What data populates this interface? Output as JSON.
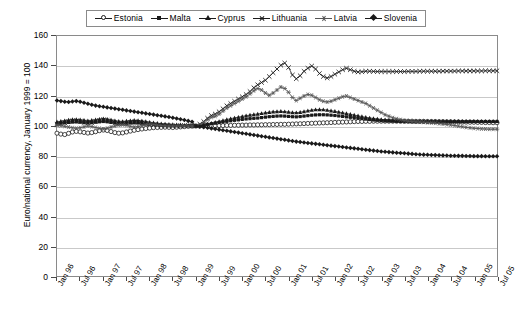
{
  "chart_data": {
    "type": "line",
    "title": "",
    "xlabel": "",
    "ylabel": "Euro/national currency, January 1999 = 100",
    "ylim": [
      0,
      160
    ],
    "ytick_step": 20,
    "yticks": [
      0,
      20,
      40,
      60,
      80,
      100,
      120,
      140,
      160
    ],
    "grid": true,
    "legend_position": "top",
    "x_tick_labels": [
      "Jan 96",
      "Jul 96",
      "Jan 97",
      "Jul 97",
      "Jan 98",
      "Jul 98",
      "Jan 99",
      "Jul 99",
      "Jan 00",
      "Jul 00",
      "Jan 01",
      "Jul 01",
      "Jan 02",
      "Jul 02",
      "Jan 03",
      "Jul 03",
      "Jan 04",
      "Jul 04",
      "Jan 05",
      "Jul 05"
    ],
    "x_start": "Jan 96",
    "x_end": "Jul 05",
    "x_frequency": "monthly",
    "n_points": 115,
    "series": [
      {
        "name": "Estonia",
        "marker": "circle-open",
        "color": "#1a1a1a",
        "values": [
          95.2,
          94.6,
          94.3,
          95.1,
          96.0,
          96.4,
          96.1,
          95.7,
          95.3,
          95.6,
          96.2,
          96.9,
          97.3,
          97.0,
          96.3,
          95.6,
          95.2,
          95.4,
          96.0,
          96.6,
          97.1,
          97.6,
          98.0,
          98.3,
          98.6,
          98.9,
          99.0,
          99.1,
          99.2,
          99.1,
          99.0,
          99.2,
          99.4,
          99.6,
          99.8,
          99.9,
          100.0,
          100.0,
          100.1,
          100.1,
          100.2,
          100.2,
          100.3,
          100.3,
          100.4,
          100.4,
          100.5,
          100.5,
          100.6,
          100.6,
          100.7,
          100.7,
          100.8,
          100.8,
          100.9,
          100.9,
          101.0,
          101.0,
          101.1,
          101.1,
          101.2,
          101.3,
          101.4,
          101.5,
          101.6,
          101.7,
          101.8,
          101.9,
          102.0,
          102.1,
          102.2,
          102.3,
          102.4,
          102.5,
          102.6,
          102.7,
          102.8,
          102.9,
          103.0,
          103.0,
          103.1,
          103.1,
          103.2,
          103.2,
          103.2,
          103.2,
          103.2,
          103.2,
          103.2,
          103.2,
          103.2,
          103.2,
          103.2,
          103.1,
          103.1,
          103.1,
          103.0,
          103.0,
          103.0,
          102.9,
          102.9,
          102.8,
          102.8,
          102.7,
          102.7,
          102.6,
          102.6,
          102.5,
          102.5,
          102.4,
          102.4,
          102.3,
          102.3,
          102.2,
          102.2
        ]
      },
      {
        "name": "Malta",
        "marker": "square-small",
        "color": "#1a1a1a",
        "values": [
          101.5,
          101.8,
          102.1,
          102.4,
          102.6,
          102.7,
          102.5,
          102.2,
          102.0,
          102.2,
          102.5,
          102.8,
          103.0,
          102.8,
          102.4,
          102.0,
          101.7,
          101.6,
          101.8,
          102.0,
          102.1,
          102.0,
          101.8,
          101.5,
          101.2,
          100.9,
          100.7,
          100.5,
          100.4,
          100.3,
          100.2,
          100.2,
          100.2,
          100.2,
          100.1,
          100.1,
          100.0,
          100.3,
          100.7,
          101.1,
          101.5,
          101.9,
          102.3,
          102.7,
          103.1,
          103.5,
          103.8,
          104.1,
          104.4,
          104.7,
          104.9,
          105.1,
          105.3,
          105.6,
          105.9,
          106.2,
          106.4,
          106.6,
          106.7,
          106.6,
          106.4,
          106.2,
          106.1,
          106.3,
          106.6,
          106.9,
          107.2,
          107.4,
          107.5,
          107.5,
          107.4,
          107.2,
          107.0,
          106.7,
          106.4,
          106.1,
          105.8,
          105.5,
          105.2,
          104.9,
          104.6,
          104.3,
          104.0,
          103.8,
          103.6,
          103.4,
          103.3,
          103.2,
          103.1,
          103.0,
          102.9,
          102.9,
          102.8,
          102.8,
          102.8,
          102.8,
          102.8,
          102.8,
          102.8,
          102.8,
          102.8,
          102.8,
          102.8,
          102.9,
          102.9,
          102.9,
          102.9,
          103.0,
          103.0,
          103.0,
          103.0,
          103.0,
          103.0,
          103.0,
          103.0
        ]
      },
      {
        "name": "Cyprus",
        "marker": "triangle",
        "color": "#1a1a1a",
        "values": [
          102.8,
          103.2,
          103.6,
          104.0,
          104.3,
          104.4,
          104.2,
          103.9,
          103.6,
          103.8,
          104.2,
          104.6,
          104.9,
          104.6,
          104.1,
          103.6,
          103.2,
          103.1,
          103.3,
          103.6,
          103.8,
          103.7,
          103.4,
          103.0,
          102.6,
          102.2,
          101.9,
          101.6,
          101.4,
          101.2,
          101.0,
          100.9,
          100.8,
          100.6,
          100.4,
          100.2,
          100.0,
          100.4,
          100.9,
          101.4,
          101.9,
          102.5,
          103.1,
          103.7,
          104.3,
          104.9,
          105.4,
          105.9,
          106.4,
          106.9,
          107.3,
          107.7,
          108.0,
          108.4,
          108.8,
          109.2,
          109.5,
          109.7,
          109.8,
          109.6,
          109.3,
          109.0,
          108.9,
          109.2,
          109.7,
          110.2,
          110.6,
          110.9,
          111.0,
          110.9,
          110.6,
          110.2,
          109.8,
          109.3,
          108.8,
          108.3,
          107.8,
          107.3,
          106.8,
          106.3,
          105.8,
          105.4,
          105.0,
          104.7,
          104.4,
          104.2,
          104.0,
          103.8,
          103.6,
          103.5,
          103.4,
          103.3,
          103.2,
          103.2,
          103.2,
          103.2,
          103.2,
          103.2,
          103.2,
          103.2,
          103.2,
          103.2,
          103.2,
          103.2,
          103.2,
          103.2,
          103.2,
          103.2,
          103.2,
          103.2,
          103.2,
          103.2,
          103.2,
          103.2,
          103.2
        ]
      },
      {
        "name": "Lithuania",
        "marker": "x",
        "color": "#1a1a1a",
        "values": [
          101.0,
          101.6,
          102.2,
          102.9,
          103.4,
          103.5,
          103.0,
          102.4,
          101.9,
          102.3,
          103.0,
          103.7,
          104.2,
          103.7,
          102.9,
          102.2,
          101.6,
          101.5,
          101.9,
          102.4,
          102.8,
          102.6,
          102.1,
          101.5,
          101.0,
          100.6,
          100.4,
          100.2,
          100.1,
          100.1,
          100.0,
          100.1,
          100.2,
          100.3,
          100.3,
          100.2,
          100.0,
          101.2,
          103.0,
          105.2,
          107.0,
          108.0,
          109.5,
          111.5,
          113.5,
          115.0,
          116.5,
          118.0,
          119.5,
          121.0,
          123.0,
          125.5,
          127.5,
          129.0,
          130.5,
          133.0,
          135.5,
          138.0,
          140.5,
          142.0,
          139.0,
          134.0,
          131.5,
          133.5,
          136.5,
          138.5,
          140.0,
          138.0,
          135.0,
          133.0,
          132.0,
          133.0,
          134.5,
          136.0,
          137.5,
          138.5,
          137.5,
          136.5,
          136.0,
          136.2,
          136.5,
          136.5,
          136.4,
          136.3,
          136.3,
          136.3,
          136.3,
          136.3,
          136.3,
          136.3,
          136.3,
          136.4,
          136.4,
          136.4,
          136.5,
          136.5,
          136.5,
          136.5,
          136.5,
          136.5,
          136.6,
          136.6,
          136.6,
          136.6,
          136.7,
          136.7,
          136.7,
          136.7,
          136.7,
          136.7,
          136.7,
          136.8,
          136.8,
          136.8,
          136.8
        ]
      },
      {
        "name": "Latvia",
        "marker": "star",
        "color": "#555555",
        "values": [
          100.5,
          100.2,
          99.8,
          99.3,
          98.8,
          98.5,
          98.8,
          99.4,
          100.0,
          99.6,
          99.0,
          98.4,
          98.0,
          98.5,
          99.3,
          100.0,
          100.6,
          100.8,
          100.4,
          99.8,
          99.3,
          99.6,
          100.2,
          100.8,
          101.2,
          101.0,
          100.6,
          100.3,
          100.1,
          100.0,
          100.0,
          100.0,
          100.0,
          100.0,
          100.0,
          100.0,
          100.0,
          101.0,
          102.5,
          104.2,
          105.8,
          106.5,
          108.0,
          110.0,
          112.0,
          113.5,
          115.0,
          116.5,
          118.0,
          119.5,
          121.5,
          123.5,
          125.0,
          124.0,
          122.0,
          120.5,
          122.0,
          124.0,
          126.0,
          125.0,
          122.5,
          119.0,
          117.0,
          118.5,
          120.0,
          121.0,
          120.5,
          119.0,
          117.5,
          116.5,
          116.0,
          116.5,
          117.5,
          118.5,
          119.5,
          120.0,
          119.0,
          118.0,
          117.0,
          116.0,
          115.0,
          113.5,
          112.0,
          110.5,
          109.0,
          107.5,
          106.5,
          105.5,
          104.8,
          104.2,
          103.6,
          103.2,
          102.9,
          102.7,
          102.6,
          102.5,
          102.3,
          102.1,
          101.9,
          101.6,
          101.3,
          101.0,
          100.7,
          100.3,
          99.9,
          99.5,
          99.1,
          98.8,
          98.5,
          98.3,
          98.1,
          98.0,
          97.9,
          97.9,
          97.9
        ]
      },
      {
        "name": "Slovenia",
        "marker": "diamond",
        "color": "#1a1a1a",
        "values": [
          117.0,
          116.6,
          116.2,
          116.0,
          116.3,
          116.6,
          116.2,
          115.5,
          114.8,
          114.2,
          113.6,
          113.2,
          112.8,
          112.4,
          112.0,
          111.6,
          111.2,
          110.8,
          110.4,
          110.0,
          109.6,
          109.2,
          108.8,
          108.4,
          108.0,
          107.6,
          107.2,
          106.8,
          106.4,
          106.0,
          105.5,
          105.0,
          104.5,
          104.0,
          103.4,
          102.8,
          100.0,
          99.6,
          99.2,
          98.8,
          98.4,
          98.0,
          97.6,
          97.2,
          96.8,
          96.4,
          96.0,
          95.6,
          95.2,
          94.8,
          94.4,
          94.0,
          93.6,
          93.2,
          92.8,
          92.4,
          92.0,
          91.6,
          91.2,
          90.8,
          90.4,
          90.0,
          89.6,
          89.3,
          89.0,
          88.7,
          88.4,
          88.1,
          87.8,
          87.5,
          87.2,
          86.9,
          86.6,
          86.3,
          86.0,
          85.7,
          85.4,
          85.1,
          84.8,
          84.5,
          84.2,
          83.9,
          83.6,
          83.3,
          83.0,
          82.8,
          82.6,
          82.4,
          82.2,
          82.0,
          81.8,
          81.6,
          81.4,
          81.2,
          81.0,
          80.9,
          80.8,
          80.7,
          80.6,
          80.5,
          80.4,
          80.3,
          80.2,
          80.2,
          80.1,
          80.1,
          80.0,
          80.0,
          79.9,
          79.9,
          79.9,
          79.8,
          79.8,
          79.8,
          79.8
        ]
      }
    ]
  }
}
